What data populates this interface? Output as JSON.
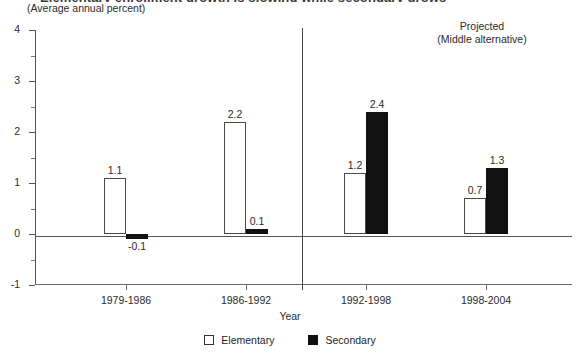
{
  "header": {
    "title_cropped": "Elementary enrollment growth is slowing while secondary grows",
    "subtitle": "(Average annual percent)"
  },
  "annotations": {
    "projected_line1": "Projected",
    "projected_line2": "(Middle alternative)"
  },
  "legend": {
    "elementary_label": "Elementary",
    "secondary_label": "Secondary"
  },
  "axes": {
    "x_title": "Year"
  },
  "chart_data": {
    "type": "bar",
    "title": "Elementary enrollment growth is slowing while secondary grows",
    "subtitle": "(Average annual percent)",
    "xlabel": "Year",
    "ylabel": "",
    "ylim": [
      -1,
      4
    ],
    "ytick_labels": [
      "4",
      "3",
      "2",
      "1",
      "0",
      "-1"
    ],
    "ytick_values": [
      4,
      3,
      2,
      1,
      0,
      -1
    ],
    "yminor_values": [
      3.5,
      2.5,
      1.5,
      0.5,
      -0.5
    ],
    "grid": false,
    "legend_position": "bottom-center",
    "categories": [
      "1979-1986",
      "1986-1992",
      "1992-1998",
      "1998-2004"
    ],
    "series": [
      {
        "name": "Elementary",
        "color": "#ffffff",
        "values": [
          1.1,
          2.2,
          1.2,
          0.7
        ]
      },
      {
        "name": "Secondary",
        "color": "#111111",
        "values": [
          -0.1,
          0.1,
          2.4,
          1.3
        ]
      }
    ],
    "value_labels": {
      "Elementary": [
        "1.1",
        "2.2",
        "1.2",
        "0.7"
      ],
      "Secondary": [
        "-0.1",
        "0.1",
        "2.4",
        "1.3"
      ]
    },
    "divider_after_category": "1986-1992",
    "divider_note": "Projected (Middle alternative)"
  }
}
